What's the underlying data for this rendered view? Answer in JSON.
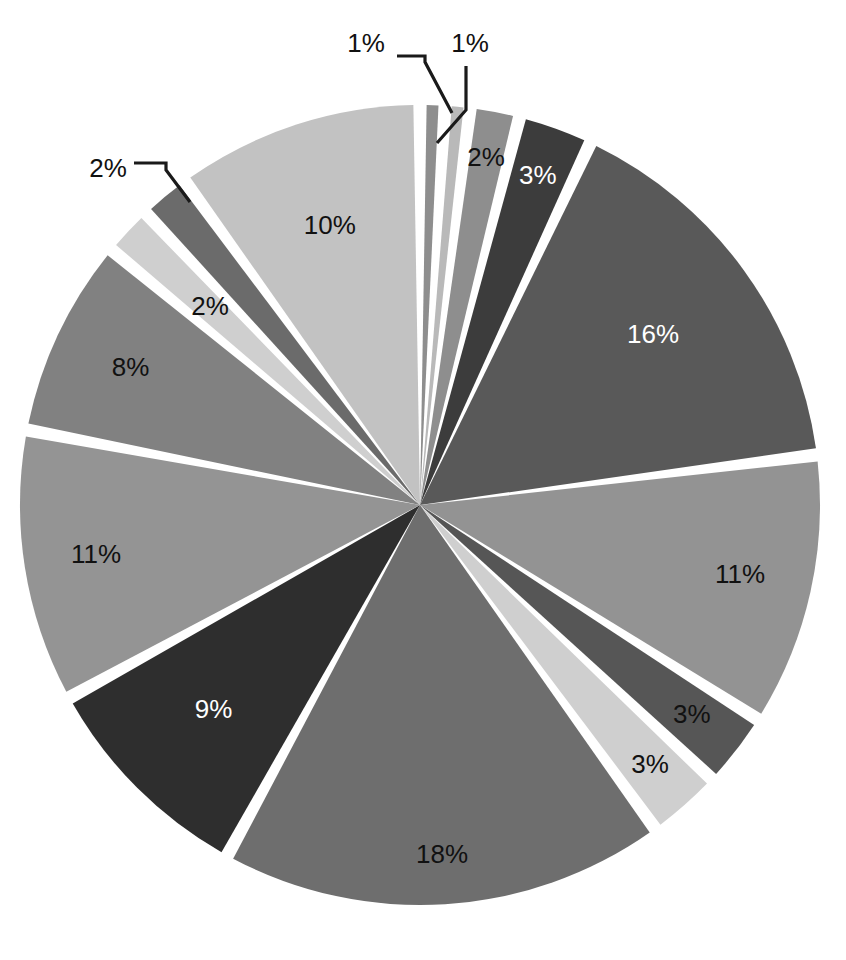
{
  "chart_data": {
    "type": "pie",
    "title": "",
    "subtitle": "",
    "xlabel": "",
    "ylabel": "",
    "legend_position": "none",
    "grid": false,
    "units": "percent",
    "label_format": "{value}%",
    "total": 101,
    "start_angle_deg": -90,
    "direction": "clockwise",
    "exploded": true,
    "gap_style": "white-radial-separators",
    "categories": [
      "Slice 1",
      "Slice 2",
      "Slice 3",
      "Slice 4",
      "Slice 5",
      "Slice 6",
      "Slice 7",
      "Slice 8",
      "Slice 9",
      "Slice 10",
      "Slice 11",
      "Slice 12",
      "Slice 13",
      "Slice 14",
      "Slice 15"
    ],
    "values": [
      1,
      1,
      2,
      3,
      16,
      11,
      3,
      3,
      18,
      9,
      11,
      8,
      2,
      2,
      10
    ],
    "slices": [
      {
        "index": 0,
        "label": "1%",
        "value": 1,
        "fill": "#8e8e8e",
        "label_color": "#111111",
        "label_placement": "callout",
        "callout_x": 366,
        "callout_y": 45
      },
      {
        "index": 1,
        "label": "1%",
        "value": 1,
        "fill": "#b9b9b9",
        "label_color": "#111111",
        "label_placement": "callout",
        "callout_x": 470,
        "callout_y": 45
      },
      {
        "index": 2,
        "label": "2%",
        "value": 2,
        "fill": "#8e8e8e",
        "label_color": "#111111",
        "label_placement": "inside",
        "label_radius_frac": 0.88
      },
      {
        "index": 3,
        "label": "3%",
        "value": 3,
        "fill": "#3c3c3c",
        "label_color": "#ffffff",
        "label_placement": "inside",
        "label_radius_frac": 0.87
      },
      {
        "index": 4,
        "label": "16%",
        "value": 16,
        "fill": "#595959",
        "label_color": "#ffffff",
        "label_placement": "inside",
        "label_radius_frac": 0.72
      },
      {
        "index": 5,
        "label": "11%",
        "value": 11,
        "fill": "#939393",
        "label_color": "#111111",
        "label_placement": "inside",
        "label_radius_frac": 0.82
      },
      {
        "index": 6,
        "label": "3%",
        "value": 3,
        "fill": "#565656",
        "label_color": "#111111",
        "label_placement": "inside",
        "label_radius_frac": 0.86
      },
      {
        "index": 7,
        "label": "3%",
        "value": 3,
        "fill": "#cfcfcf",
        "label_color": "#111111",
        "label_placement": "inside",
        "label_radius_frac": 0.87
      },
      {
        "index": 8,
        "label": "18%",
        "value": 18,
        "fill": "#6e6e6e",
        "label_color": "#111111",
        "label_placement": "inside",
        "label_radius_frac": 0.88
      },
      {
        "index": 9,
        "label": "9%",
        "value": 9,
        "fill": "#2e2e2e",
        "label_color": "#ffffff",
        "label_placement": "inside",
        "label_radius_frac": 0.73
      },
      {
        "index": 10,
        "label": "11%",
        "value": 11,
        "fill": "#949494",
        "label_color": "#111111",
        "label_placement": "inside",
        "label_radius_frac": 0.82
      },
      {
        "index": 11,
        "label": "8%",
        "value": 8,
        "fill": "#818181",
        "label_color": "#111111",
        "label_placement": "inside",
        "label_radius_frac": 0.8
      },
      {
        "index": 12,
        "label": "2%",
        "value": 2,
        "fill": "#cfcfcf",
        "label_color": "#111111",
        "label_placement": "inside",
        "label_radius_frac": 0.72
      },
      {
        "index": 13,
        "label": "2%",
        "value": 2,
        "fill": "#6b6b6b",
        "label_color": "#111111",
        "label_placement": "callout",
        "callout_x": 108,
        "callout_y": 170
      },
      {
        "index": 14,
        "label": "10%",
        "value": 10,
        "fill": "#c2c2c2",
        "label_color": "#111111",
        "label_placement": "inside",
        "label_radius_frac": 0.73
      }
    ],
    "geometry": {
      "center_x": 420,
      "center_y": 505,
      "radius": 400,
      "gap_deg": 1.9
    },
    "callouts": [
      {
        "name": "callout-1pct-left",
        "label": "1%",
        "points": "397,56 425,56 425,62 452,113"
      },
      {
        "name": "callout-1pct-right",
        "label": "1%",
        "points": "466,66 466,110 437,143"
      },
      {
        "name": "callout-2pct-left",
        "label": "2%",
        "points": "134,163 166,163 166,170 190,202"
      }
    ],
    "background_color": "#ffffff",
    "separator_color": "#ffffff"
  },
  "page": {
    "figure_name": "pie-chart-figure",
    "width": 846,
    "height": 960
  }
}
